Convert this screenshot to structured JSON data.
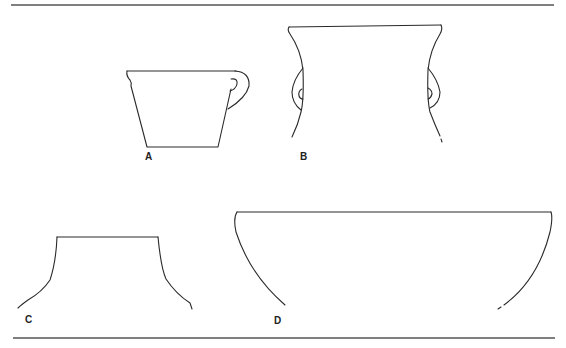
{
  "figure": {
    "type": "line-drawing",
    "colors": {
      "line": "#2a2a2a",
      "rule": "#555555",
      "background": "#ffffff"
    },
    "vessels": [
      {
        "id": "A",
        "label": "A",
        "description": "cup with loop handle"
      },
      {
        "id": "B",
        "label": "B",
        "description": "wide-mouthed jar with two lug handles"
      },
      {
        "id": "C",
        "label": "C",
        "description": "neck and shoulder fragment"
      },
      {
        "id": "D",
        "label": "D",
        "description": "large hemispherical bowl"
      }
    ]
  }
}
